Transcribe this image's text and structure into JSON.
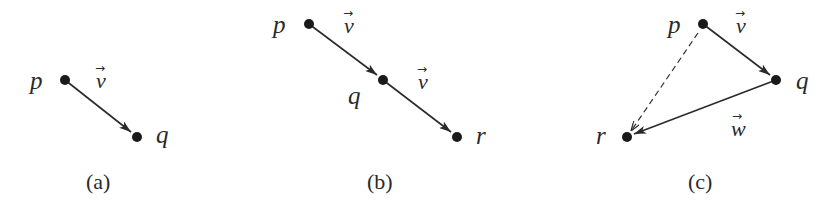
{
  "diagram": {
    "type": "vector-addition",
    "panels": [
      {
        "caption": "(a)",
        "points": [
          {
            "label": "p",
            "x": 65,
            "y": 80
          },
          {
            "label": "q",
            "x": 137,
            "y": 137
          }
        ],
        "vectors": [
          {
            "label": "v",
            "from": "p",
            "to": "q",
            "style": "solid"
          }
        ]
      },
      {
        "caption": "(b)",
        "points": [
          {
            "label": "p",
            "x": 309,
            "y": 24
          },
          {
            "label": "q",
            "x": 383,
            "y": 80
          },
          {
            "label": "r",
            "x": 457,
            "y": 137
          }
        ],
        "vectors": [
          {
            "label": "v",
            "from": "p",
            "to": "q",
            "style": "solid"
          },
          {
            "label": "v",
            "from": "q",
            "to": "r",
            "style": "solid"
          }
        ]
      },
      {
        "caption": "(c)",
        "points": [
          {
            "label": "p",
            "x": 703,
            "y": 24
          },
          {
            "label": "q",
            "x": 776,
            "y": 80
          },
          {
            "label": "r",
            "x": 627,
            "y": 137
          }
        ],
        "vectors": [
          {
            "label": "v",
            "from": "p",
            "to": "q",
            "style": "solid"
          },
          {
            "label": "w",
            "from": "q",
            "to": "r",
            "style": "solid"
          },
          {
            "label": "",
            "from": "p",
            "to": "r",
            "style": "dashed"
          }
        ]
      }
    ]
  },
  "labels": {
    "a": {
      "p": "p",
      "q": "q",
      "v": "v",
      "caption": "(a)"
    },
    "b": {
      "p": "p",
      "q": "q",
      "r": "r",
      "v1": "v",
      "v2": "v",
      "caption": "(b)"
    },
    "c": {
      "p": "p",
      "q": "q",
      "r": "r",
      "v": "v",
      "w": "w",
      "caption": "(c)"
    }
  },
  "arrow_glyph": "→"
}
